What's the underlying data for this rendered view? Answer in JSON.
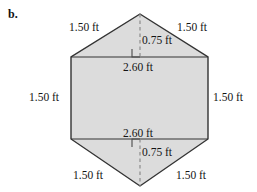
{
  "figure": {
    "part_label": "b.",
    "shape": "hexagon",
    "fill_color": "#dcdcdc",
    "stroke_color": "#333333",
    "dashed_color": "#8c8c8c",
    "background_color": "#ffffff",
    "geometry": {
      "apex_top": [
        140,
        14
      ],
      "rect_top_left": [
        71,
        57
      ],
      "rect_top_right": [
        208,
        57
      ],
      "rect_bottom_left": [
        71,
        139
      ],
      "rect_bottom_right": [
        208,
        139
      ],
      "apex_bottom": [
        140,
        186
      ]
    },
    "labels": {
      "top_left_side": "1.50 ft",
      "top_right_side": "1.50 ft",
      "left_side": "1.50 ft",
      "right_side": "1.50 ft",
      "bottom_left_side": "1.50 ft",
      "bottom_right_side": "1.50 ft",
      "top_base": "2.60 ft",
      "bottom_base": "2.60 ft",
      "top_height": "0.75 ft",
      "bottom_height": "0.75 ft"
    }
  }
}
